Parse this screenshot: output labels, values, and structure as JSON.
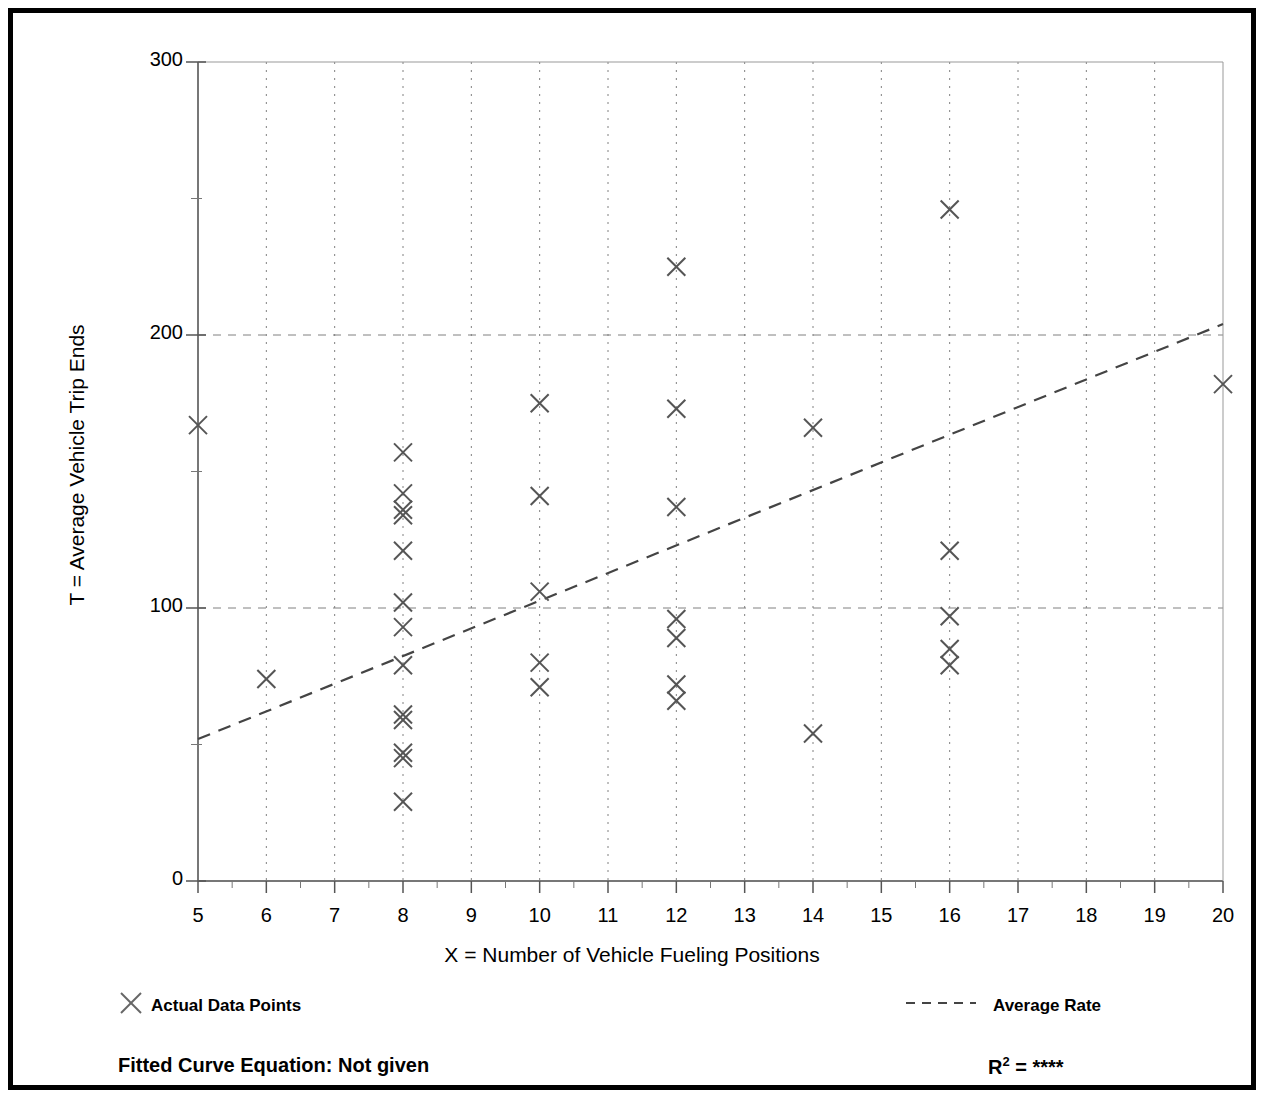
{
  "figure": {
    "border_color": "#000000",
    "background": "#ffffff"
  },
  "axes": {
    "x_title": "X = Number of Vehicle Fueling Positions",
    "y_title": "T = Average Vehicle Trip Ends",
    "x_ticks": [
      "5",
      "6",
      "7",
      "8",
      "9",
      "10",
      "11",
      "12",
      "13",
      "14",
      "15",
      "16",
      "17",
      "18",
      "19",
      "20"
    ],
    "y_ticks": [
      "0",
      "100",
      "200",
      "300"
    ]
  },
  "legend": {
    "points_marker": "x-marker-icon",
    "points_label": "Actual Data Points",
    "line_marker": "dashed-line-icon",
    "line_label": "Average Rate"
  },
  "footer": {
    "equation_label": "Fitted Curve Equation:  Not given",
    "r_squared_base": "R",
    "r_squared_exponent": "2",
    "r_squared_value": " = ****"
  },
  "chart_data": {
    "type": "scatter",
    "title": "",
    "xlabel": "X = Number of Vehicle Fueling Positions",
    "ylabel": "T = Average Vehicle Trip Ends",
    "xlim": [
      5,
      20
    ],
    "ylim": [
      0,
      300
    ],
    "x_ticks": [
      5,
      6,
      7,
      8,
      9,
      10,
      11,
      12,
      13,
      14,
      15,
      16,
      17,
      18,
      19,
      20
    ],
    "y_ticks": [
      0,
      100,
      200,
      300
    ],
    "grid": true,
    "grid_style": "dotted vertical at each integer x; dashed horizontal at 100 and 200",
    "legend_position": "below-axes",
    "series": [
      {
        "name": "Actual Data Points",
        "type": "scatter",
        "marker": "x",
        "color": "#555555",
        "points": [
          {
            "x": 5,
            "y": 167
          },
          {
            "x": 6,
            "y": 74
          },
          {
            "x": 8,
            "y": 157
          },
          {
            "x": 8,
            "y": 142
          },
          {
            "x": 8,
            "y": 136
          },
          {
            "x": 8,
            "y": 134
          },
          {
            "x": 8,
            "y": 121
          },
          {
            "x": 8,
            "y": 102
          },
          {
            "x": 8,
            "y": 93
          },
          {
            "x": 8,
            "y": 79
          },
          {
            "x": 8,
            "y": 61
          },
          {
            "x": 8,
            "y": 59
          },
          {
            "x": 8,
            "y": 47
          },
          {
            "x": 8,
            "y": 45
          },
          {
            "x": 8,
            "y": 29
          },
          {
            "x": 10,
            "y": 175
          },
          {
            "x": 10,
            "y": 141
          },
          {
            "x": 10,
            "y": 106
          },
          {
            "x": 10,
            "y": 80
          },
          {
            "x": 10,
            "y": 71
          },
          {
            "x": 12,
            "y": 225
          },
          {
            "x": 12,
            "y": 173
          },
          {
            "x": 12,
            "y": 137
          },
          {
            "x": 12,
            "y": 96
          },
          {
            "x": 12,
            "y": 89
          },
          {
            "x": 12,
            "y": 72
          },
          {
            "x": 12,
            "y": 66
          },
          {
            "x": 14,
            "y": 166
          },
          {
            "x": 14,
            "y": 54
          },
          {
            "x": 16,
            "y": 246
          },
          {
            "x": 16,
            "y": 121
          },
          {
            "x": 16,
            "y": 97
          },
          {
            "x": 16,
            "y": 85
          },
          {
            "x": 16,
            "y": 79
          },
          {
            "x": 20,
            "y": 182
          }
        ]
      },
      {
        "name": "Average Rate",
        "type": "line",
        "style": "dashed",
        "color": "#444444",
        "endpoints": [
          {
            "x": 5,
            "y": 52
          },
          {
            "x": 20,
            "y": 204
          }
        ]
      }
    ]
  }
}
